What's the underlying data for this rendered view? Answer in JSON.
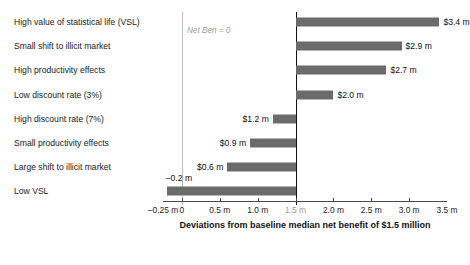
{
  "chart_data": {
    "type": "bar",
    "orientation": "horizontal",
    "title": "",
    "xlabel": "Deviations from baseline median net benefit of $1.5 million",
    "ylabel": "",
    "xlim": [
      -0.25,
      3.5
    ],
    "xticks": [
      -0.25,
      0,
      0.5,
      1.0,
      1.5,
      2.0,
      2.5,
      3.0,
      3.5
    ],
    "xtick_labels": [
      "–0.25 m",
      "0",
      "0.5 m",
      "1.0 m",
      "1.5 m",
      "2.0 m",
      "2.5 m",
      "3.0 m",
      "3.5 m"
    ],
    "baseline_value": 1.5,
    "zero_reference": 0,
    "grid": false,
    "legend": null,
    "annotations": [
      {
        "text": "Net Ben = 0",
        "x": 0,
        "style": "italic-gray"
      }
    ],
    "categories": [
      "High value of statistical life (VSL)",
      "Small shift to illicit market",
      "High productivity effects",
      "Low discount rate (3%)",
      "High discount rate (7%)",
      "Small productivity effects",
      "Large shift to illicit market",
      "Low VSL"
    ],
    "values": [
      3.4,
      2.9,
      2.7,
      2.0,
      1.2,
      0.9,
      0.6,
      -0.2
    ],
    "value_labels": [
      "$3.4 m",
      "$2.9 m",
      "$2.7 m",
      "$2.0 m",
      "$1.2 m",
      "$0.9 m",
      "$0.6 m",
      "–0.2 m"
    ],
    "colors": {
      "bar_fill": "#6b6b6b",
      "baseline_line": "#111111",
      "zero_line": "#bdbdbd",
      "axis_line": "#4a4a4a",
      "text": "#1a1a1a",
      "muted_text": "#9a9a9a",
      "background": "#ffffff"
    }
  }
}
